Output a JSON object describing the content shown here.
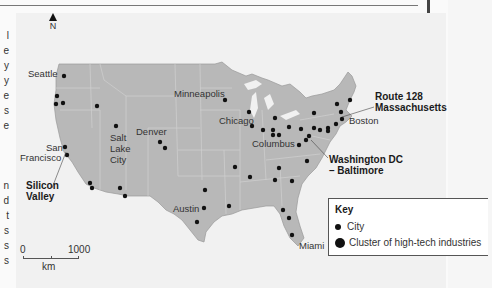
{
  "map": {
    "north_label": "N",
    "scale": {
      "start": "0",
      "end": "1000",
      "unit": "km"
    },
    "cities": [
      {
        "name": "Seattle",
        "x": 64,
        "y": 76
      },
      {
        "name": "San Francisco",
        "x": 64,
        "y": 148
      },
      {
        "name": "Salt Lake City",
        "x": 116,
        "y": 127
      },
      {
        "name": "Denver",
        "x": 160,
        "y": 144
      },
      {
        "name": "Minneapolis",
        "x": 225,
        "y": 72
      },
      {
        "name": "Chicago",
        "x": 252,
        "y": 124
      },
      {
        "name": "Columbus",
        "x": 284,
        "y": 135
      },
      {
        "name": "Boston",
        "x": 345,
        "y": 119
      },
      {
        "name": "Austin",
        "x": 202,
        "y": 209
      },
      {
        "name": "Miami",
        "x": 294,
        "y": 237
      }
    ],
    "labels": {
      "seattle": "Seattle",
      "san": "San",
      "francisco": "Francisco",
      "silicon": "Silicon",
      "valley": "Valley",
      "salt": "Salt",
      "lake": "Lake",
      "city": "City",
      "denver": "Denver",
      "minneapolis": "Minneapolis",
      "chicago": "Chicago",
      "columbus": "Columbus",
      "route128": "Route 128",
      "massachusetts": "Massachusetts",
      "boston": "Boston",
      "washington": "Washington DC",
      "baltimore": "– Baltimore",
      "austin": "Austin",
      "miami": "Miami"
    }
  },
  "key": {
    "title": "Key",
    "items": [
      {
        "symbol": "small-dot",
        "label": "City"
      },
      {
        "symbol": "large-dot",
        "label": "Cluster of high-tech industries"
      }
    ]
  },
  "left_margin_text": [
    "l",
    "e",
    "y",
    "y",
    "e",
    "s",
    "e",
    "",
    "n",
    "d",
    "t",
    "s",
    "s",
    "s"
  ],
  "colors": {
    "land": "#b8b8b8",
    "sea": "#f1f1f1",
    "dot": "#111111",
    "borders": "#d4d4d4"
  }
}
